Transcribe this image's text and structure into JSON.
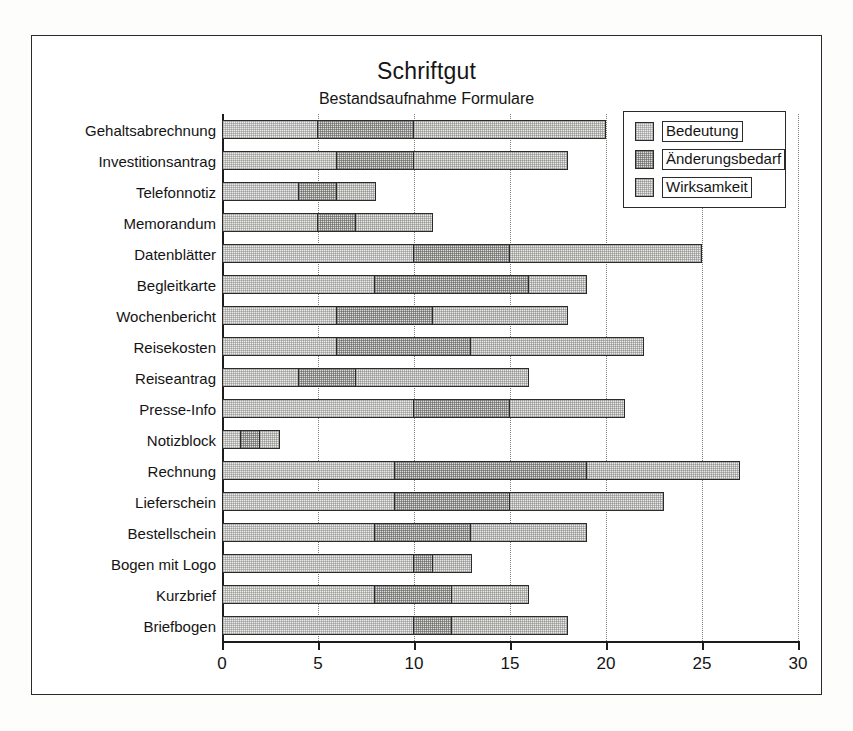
{
  "chart_data": {
    "type": "bar",
    "orientation": "horizontal",
    "stacked": true,
    "title": "Schriftgut",
    "subtitle": "Bestandsaufnahme Formulare",
    "xlabel": "",
    "ylabel": "",
    "xlim": [
      0,
      30
    ],
    "xticks": [
      0,
      5,
      10,
      15,
      20,
      25,
      30
    ],
    "grid": "vertical-dotted",
    "legend_position": "top-right",
    "categories": [
      "Gehaltsabrechnung",
      "Investitionsantrag",
      "Telefonnotiz",
      "Memorandum",
      "Datenblätter",
      "Begleitkarte",
      "Wochenbericht",
      "Reisekosten",
      "Reiseantrag",
      "Presse-Info",
      "Notizblock",
      "Rechnung",
      "Lieferschein",
      "Bestellschein",
      "Bogen mit Logo",
      "Kurzbrief",
      "Briefbogen"
    ],
    "series": [
      {
        "name": "Bedeutung",
        "values": [
          5,
          6,
          4,
          5,
          10,
          8,
          6,
          6,
          4,
          10,
          1,
          9,
          9,
          8,
          10,
          8,
          10
        ]
      },
      {
        "name": "Änderungsbedarf",
        "values": [
          5,
          4,
          2,
          2,
          5,
          8,
          5,
          7,
          3,
          5,
          1,
          10,
          6,
          5,
          1,
          4,
          2
        ]
      },
      {
        "name": "Wirksamkeit",
        "values": [
          10,
          8,
          2,
          4,
          10,
          3,
          7,
          9,
          9,
          6,
          1,
          8,
          8,
          6,
          2,
          4,
          6
        ]
      }
    ],
    "cumulative_boundaries": [
      [
        5,
        10,
        20
      ],
      [
        6,
        10,
        18
      ],
      [
        4,
        6,
        8
      ],
      [
        5,
        7,
        11
      ],
      [
        10,
        15,
        25
      ],
      [
        8,
        16,
        19
      ],
      [
        6,
        11,
        18
      ],
      [
        6,
        13,
        22
      ],
      [
        4,
        7,
        16
      ],
      [
        10,
        15,
        21
      ],
      [
        1,
        2,
        3
      ],
      [
        9,
        19,
        27
      ],
      [
        9,
        15,
        23
      ],
      [
        8,
        13,
        19
      ],
      [
        10,
        11,
        13
      ],
      [
        8,
        12,
        16
      ],
      [
        10,
        12,
        18
      ]
    ],
    "totals": [
      20,
      18,
      8,
      11,
      25,
      19,
      18,
      22,
      16,
      21,
      3,
      27,
      23,
      19,
      13,
      16,
      18
    ],
    "colors": {
      "series1": "#ececeb",
      "series2": "#dededb",
      "series3": "#eaeae8",
      "outline": "#2b2b2b",
      "axis": "#1c1c1c",
      "grid": "#7d7d7d",
      "background": "#ffffff"
    }
  },
  "legend": {
    "items": [
      {
        "label": "Bedeutung"
      },
      {
        "label": "Änderungsbedarf"
      },
      {
        "label": "Wirksamkeit"
      }
    ]
  }
}
